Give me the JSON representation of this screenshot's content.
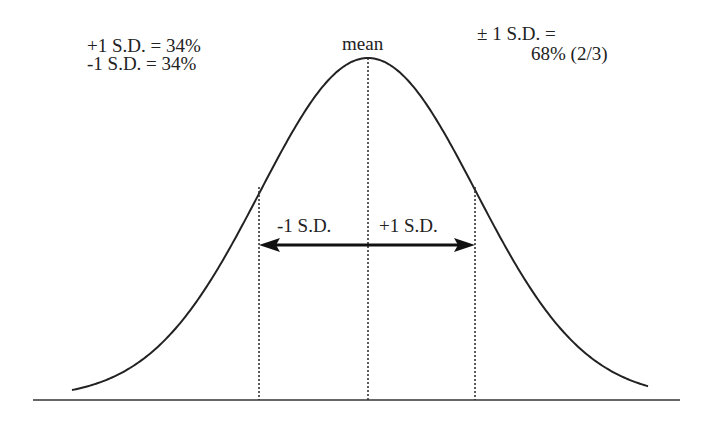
{
  "labels": {
    "top_left_line1": "+1 S.D. = 34%",
    "top_left_line2": "-1 S.D. = 34%",
    "mean": "mean",
    "top_right_line1": "± 1 S.D. =",
    "top_right_line2": "68% (2/3)",
    "minus_sd": "-1 S.D.",
    "plus_sd": "+1 S.D."
  },
  "chart_data": {
    "type": "line",
    "title": "",
    "xlabel": "",
    "ylabel": "",
    "grid": false,
    "annotations": [
      "+1 S.D. = 34%",
      "-1 S.D. = 34%",
      "mean",
      "± 1 S.D. = 68% (2/3)",
      "-1 S.D.",
      "+1 S.D."
    ],
    "markers": [
      {
        "name": "-1 S.D.",
        "x_sd": -1,
        "style": "dotted"
      },
      {
        "name": "mean",
        "x_sd": 0,
        "style": "dotted"
      },
      {
        "name": "+1 S.D.",
        "x_sd": 1,
        "style": "dotted"
      }
    ],
    "proportions": {
      "plus_1_sd": 34,
      "minus_1_sd": 34,
      "within_1_sd": 68
    }
  },
  "colors": {
    "ink": "#222222"
  }
}
